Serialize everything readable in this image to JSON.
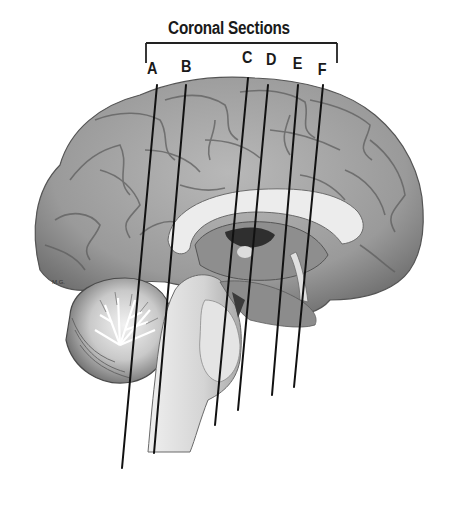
{
  "diagram": {
    "title": "Coronal Sections",
    "signature": "M.G.",
    "colors": {
      "background": "#ffffff",
      "line": "#111111",
      "cortex": "#9a9a9a",
      "white_matter": "#e6e6e6",
      "dark_ventricle": "#3a3a3a"
    },
    "sections": [
      {
        "label": "A",
        "label_x": 147,
        "label_y": 58,
        "line": {
          "x1": 157,
          "y1": 85,
          "x2": 122,
          "y2": 468
        }
      },
      {
        "label": "B",
        "label_x": 181,
        "label_y": 56,
        "line": {
          "x1": 186,
          "y1": 85,
          "x2": 154,
          "y2": 453
        }
      },
      {
        "label": "C",
        "label_x": 242,
        "label_y": 48,
        "line": {
          "x1": 248,
          "y1": 78,
          "x2": 215,
          "y2": 425
        }
      },
      {
        "label": "D",
        "label_x": 266,
        "label_y": 50,
        "line": {
          "x1": 268,
          "y1": 85,
          "x2": 238,
          "y2": 410
        }
      },
      {
        "label": "E",
        "label_x": 293,
        "label_y": 54,
        "line": {
          "x1": 298,
          "y1": 85,
          "x2": 272,
          "y2": 395
        }
      },
      {
        "label": "F",
        "label_x": 318,
        "label_y": 59,
        "line": {
          "x1": 323,
          "y1": 85,
          "x2": 294,
          "y2": 387
        }
      }
    ],
    "bracket": {
      "x1": 146,
      "x2": 337,
      "y": 43,
      "drop": 20
    }
  }
}
